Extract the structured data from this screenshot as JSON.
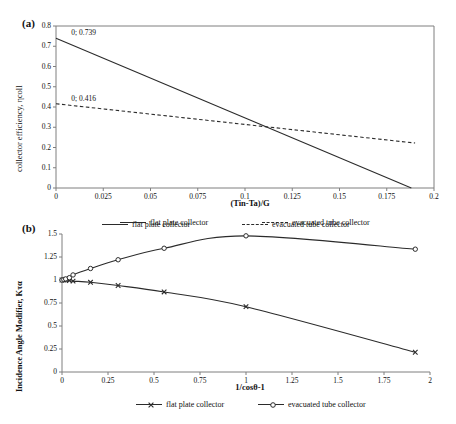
{
  "figure": {
    "panel_a_tag": "(a)",
    "panel_b_tag": "(b)"
  },
  "chart_data": [
    {
      "id": "panel_a",
      "type": "line",
      "title": "",
      "xlabel": "(Tin-Ta)/G",
      "ylabel": "collector efficiency, ηcoll",
      "xlim": [
        0,
        0.2
      ],
      "ylim": [
        0,
        0.8
      ],
      "xticks": [
        "0",
        "0.025",
        "0.05",
        "0.075",
        "0.1",
        "0.125",
        "0.15",
        "0.175",
        "0.2"
      ],
      "xtick_values": [
        0,
        0.025,
        0.05,
        0.075,
        0.1,
        0.125,
        0.15,
        0.175,
        0.2
      ],
      "yticks": [
        "0",
        "0.1",
        "0.2",
        "0.3",
        "0.4",
        "0.5",
        "0.6",
        "0.7",
        "0.8"
      ],
      "ytick_values": [
        0,
        0.1,
        0.2,
        0.3,
        0.4,
        0.5,
        0.6,
        0.7,
        0.8
      ],
      "grid": false,
      "legend_position": "bottom",
      "series": [
        {
          "name": "flat plate collector",
          "style": "solid",
          "marker": "none",
          "color": "#2b2b2b",
          "x": [
            0,
            0.188
          ],
          "values": [
            0.739,
            0
          ]
        },
        {
          "name": "evacuated tube collector",
          "style": "dashed",
          "marker": "none",
          "color": "#2b2b2b",
          "x": [
            0,
            0.19
          ],
          "values": [
            0.416,
            0.222
          ]
        }
      ],
      "annotations": [
        {
          "text": "0; 0.739",
          "x": 0.006,
          "y": 0.739
        },
        {
          "text": "0; 0.416",
          "x": 0.006,
          "y": 0.416
        }
      ]
    },
    {
      "id": "panel_b",
      "type": "line",
      "title": "",
      "xlabel": "1/cosθ-1",
      "ylabel": "Incidence Angle Modifier, Kτα",
      "xlim": [
        0,
        2
      ],
      "ylim": [
        0,
        1.5
      ],
      "xticks": [
        "0",
        "0.25",
        "0.5",
        "0.75",
        "1",
        "1.25",
        "1.5",
        "1.75",
        "2"
      ],
      "xtick_values": [
        0,
        0.25,
        0.5,
        0.75,
        1,
        1.25,
        1.5,
        1.75,
        2
      ],
      "yticks": [
        "0",
        "0.25",
        "0.5",
        "0.75",
        "1",
        "1.25",
        "1.5"
      ],
      "ytick_values": [
        0,
        0.25,
        0.5,
        0.75,
        1,
        1.25,
        1.5
      ],
      "grid": false,
      "legend_position": "top-and-bottom",
      "series": [
        {
          "name": "flat plate collector",
          "style": "solid",
          "marker": "x",
          "color": "#2b2b2b",
          "x": [
            0,
            0.01,
            0.02,
            0.04,
            0.06,
            0.155,
            0.305,
            0.555,
            1.0,
            1.92
          ],
          "values": [
            1.0,
            1.0,
            0.998,
            0.995,
            0.988,
            0.975,
            0.94,
            0.87,
            0.71,
            0.215
          ]
        },
        {
          "name": "evacuated tube collector",
          "style": "solid",
          "marker": "o",
          "color": "#2b2b2b",
          "x": [
            0,
            0.01,
            0.02,
            0.04,
            0.06,
            0.155,
            0.305,
            0.555,
            1.0,
            1.92
          ],
          "values": [
            1.0,
            1.005,
            1.012,
            1.025,
            1.055,
            1.125,
            1.22,
            1.345,
            1.48,
            1.335
          ]
        }
      ],
      "annotations": []
    }
  ],
  "legends": {
    "panel_a": [
      {
        "label": "flat plate collector",
        "style": "solid",
        "marker": "none"
      },
      {
        "label": "evacuated tube collector",
        "style": "dashed",
        "marker": "none"
      }
    ],
    "panel_b_top": [
      {
        "label": "flat plate collector",
        "style": "solid",
        "marker": "none"
      },
      {
        "label": "evacuated tube collector",
        "style": "dashed",
        "marker": "none"
      }
    ],
    "panel_b_bottom": [
      {
        "label": "flat plate collector",
        "style": "solid",
        "marker": "x"
      },
      {
        "label": "evacuated tube collector",
        "style": "solid",
        "marker": "o"
      }
    ]
  }
}
